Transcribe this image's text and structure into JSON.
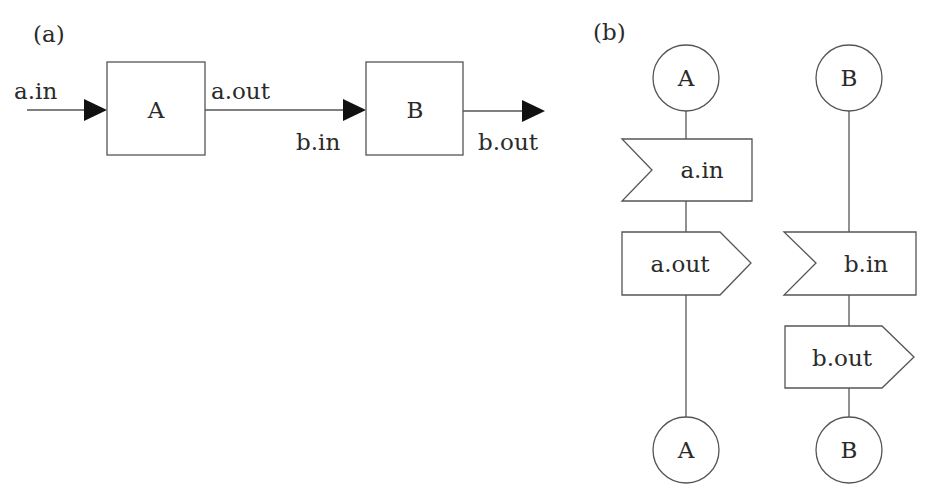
{
  "panel_a": {
    "label": "(a)",
    "boxes": [
      {
        "id": "A",
        "label": "A"
      },
      {
        "id": "B",
        "label": "B"
      }
    ],
    "ports": {
      "a_in": "a.in",
      "a_out": "a.out",
      "b_in": "b.in",
      "b_out": "b.out"
    }
  },
  "panel_b": {
    "label": "(b)",
    "columns": [
      {
        "id": "A",
        "start_label": "A",
        "end_label": "A",
        "signals": [
          {
            "type": "input",
            "label": "a.in"
          },
          {
            "type": "output",
            "label": "a.out"
          }
        ]
      },
      {
        "id": "B",
        "start_label": "B",
        "end_label": "B",
        "signals": [
          {
            "type": "input",
            "label": "b.in"
          },
          {
            "type": "output",
            "label": "b.out"
          }
        ]
      }
    ]
  },
  "colors": {
    "line": "#555555",
    "arrow": "#111111",
    "text": "#2a2a2a",
    "background": "#ffffff"
  }
}
